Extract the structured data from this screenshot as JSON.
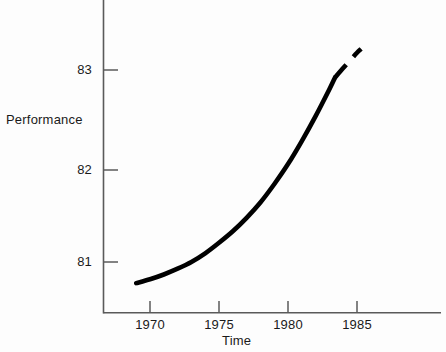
{
  "chart_data": {
    "type": "line",
    "title": "",
    "subtitle": "",
    "xlabel": "Time",
    "ylabel": "Performance",
    "xlim": [
      1967.5,
      1988.0
    ],
    "ylim": [
      80.55,
      83.35
    ],
    "xticks": [
      1970,
      1975,
      1980,
      1985
    ],
    "xticklabels": [
      "1970",
      "1975",
      "1980",
      "1985"
    ],
    "yticks": [
      81,
      82,
      83
    ],
    "yticklabels": [
      "81",
      "82",
      "83"
    ],
    "grid": false,
    "legend": null,
    "annotations": [],
    "series": [
      {
        "name": "Performance (observed)",
        "style": "solid",
        "color": "#000000",
        "linewidth": 4,
        "x": [
          1969.0,
          1970.0,
          1971.0,
          1972.0,
          1973.0,
          1974.0,
          1975.0,
          1976.0,
          1977.0,
          1978.0,
          1979.0,
          1980.0,
          1981.0,
          1982.0,
          1983.0,
          1983.4
        ],
        "y": [
          80.78,
          80.82,
          80.87,
          80.93,
          81.0,
          81.09,
          81.2,
          81.32,
          81.46,
          81.62,
          81.81,
          82.02,
          82.26,
          82.52,
          82.8,
          82.92
        ]
      },
      {
        "name": "Performance (projected)",
        "style": "dashed",
        "color": "#000000",
        "linewidth": 4,
        "x": [
          1983.4,
          1984.0,
          1984.5,
          1985.0,
          1985.3
        ],
        "y": [
          82.92,
          83.02,
          83.1,
          83.18,
          83.22
        ]
      }
    ]
  },
  "axis": {
    "y_tick_labels": [
      "83",
      "82",
      "81"
    ],
    "x_tick_labels": [
      "1970",
      "1975",
      "1980",
      "1985"
    ],
    "y_axis_title": "Performance",
    "x_axis_title": "Time"
  },
  "colors": {
    "background": "#fdfdfd",
    "axis": "#4d4d4d",
    "curve": "#000000",
    "text": "#1a1a1a"
  }
}
